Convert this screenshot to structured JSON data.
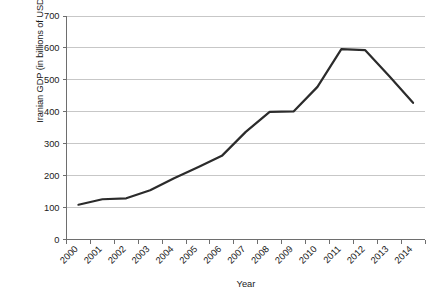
{
  "chart_data": {
    "type": "line",
    "title": "",
    "xlabel": "Year",
    "ylabel": "Iranian GDP (in billions of USD)",
    "categories": [
      "2000",
      "2001",
      "2002",
      "2003",
      "2004",
      "2005",
      "2006",
      "2007",
      "2008",
      "2009",
      "2010",
      "2011",
      "2012",
      "2013",
      "2014"
    ],
    "series": [
      {
        "name": "Iranian GDP",
        "values": [
          109,
          126,
          129,
          154,
          192,
          226,
          262,
          337,
          400,
          401,
          478,
          596,
          593,
          512,
          428
        ],
        "color": "#2b2b2b"
      }
    ],
    "ylim": [
      0,
      700
    ],
    "y_ticks": [
      "0",
      "100",
      "200",
      "300",
      "400",
      "500",
      "600",
      "700"
    ],
    "y_tick_values": [
      0,
      100,
      200,
      300,
      400,
      500,
      600,
      700
    ],
    "grid": "horizontal",
    "legend": "none",
    "x_tick_label_rotation": "-45"
  },
  "axes": {
    "y_title": "Iranian GDP (in billions of USD)",
    "x_title": "Year"
  },
  "colors": {
    "line": "#2b2b2b",
    "grid": "#b9b9b9",
    "axis": "#6e6e6e",
    "text": "#1a1a1a",
    "background": "#ffffff"
  }
}
